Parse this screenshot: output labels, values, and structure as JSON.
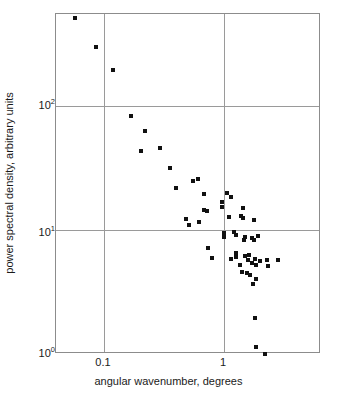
{
  "chart_data": {
    "type": "scatter",
    "title": "",
    "xlabel": "angular wavenumber, degrees",
    "ylabel": "power spectral density, arbitrary units",
    "xscale": "log",
    "yscale": "log",
    "xlim": [
      0.0562,
      4.34
    ],
    "ylim": [
      1.0,
      610
    ],
    "xticks": [
      0.1,
      1
    ],
    "xticklabels": [
      "0.1",
      "1"
    ],
    "yticks": [
      1,
      10,
      100
    ],
    "yticklabels": [
      "10⁰",
      "10¹",
      "10²"
    ],
    "grid": true,
    "grid_color": "#9a9a9a",
    "legend": "none",
    "marker": "square",
    "marker_color": "#111111",
    "marker_size_px": 4,
    "n_points": 59,
    "points": [
      {
        "x": 0.0575,
        "y": 513
      },
      {
        "x": 0.0862,
        "y": 300
      },
      {
        "x": 0.118,
        "y": 194
      },
      {
        "x": 0.167,
        "y": 83
      },
      {
        "x": 0.219,
        "y": 62.5
      },
      {
        "x": 0.203,
        "y": 43.5
      },
      {
        "x": 0.295,
        "y": 46.0
      },
      {
        "x": 0.352,
        "y": 31.5
      },
      {
        "x": 0.398,
        "y": 21.8
      },
      {
        "x": 0.478,
        "y": 12.3
      },
      {
        "x": 0.513,
        "y": 10.9
      },
      {
        "x": 0.556,
        "y": 25.0
      },
      {
        "x": 0.602,
        "y": 26.0
      },
      {
        "x": 0.617,
        "y": 11.6
      },
      {
        "x": 0.675,
        "y": 19.5
      },
      {
        "x": 0.681,
        "y": 14.6
      },
      {
        "x": 0.724,
        "y": 14.1
      },
      {
        "x": 0.74,
        "y": 7.2
      },
      {
        "x": 0.794,
        "y": 5.9
      },
      {
        "x": 0.955,
        "y": 15.4
      },
      {
        "x": 0.955,
        "y": 16.7
      },
      {
        "x": 1.05,
        "y": 20.0
      },
      {
        "x": 1.15,
        "y": 18.3
      },
      {
        "x": 1.1,
        "y": 12.8
      },
      {
        "x": 1.2,
        "y": 9.7
      },
      {
        "x": 1.0,
        "y": 9.4
      },
      {
        "x": 1.0,
        "y": 8.8
      },
      {
        "x": 1.38,
        "y": 13.0
      },
      {
        "x": 1.45,
        "y": 12.6
      },
      {
        "x": 1.45,
        "y": 15.1
      },
      {
        "x": 1.78,
        "y": 12.0
      },
      {
        "x": 1.26,
        "y": 9.1
      },
      {
        "x": 1.51,
        "y": 8.8
      },
      {
        "x": 1.48,
        "y": 8.3
      },
      {
        "x": 1.7,
        "y": 8.6
      },
      {
        "x": 1.78,
        "y": 8.3
      },
      {
        "x": 1.91,
        "y": 9.0
      },
      {
        "x": 1.26,
        "y": 6.5
      },
      {
        "x": 1.25,
        "y": 6.1
      },
      {
        "x": 1.15,
        "y": 5.8
      },
      {
        "x": 1.35,
        "y": 5.2
      },
      {
        "x": 1.51,
        "y": 6.2
      },
      {
        "x": 1.58,
        "y": 5.7
      },
      {
        "x": 1.62,
        "y": 6.3
      },
      {
        "x": 1.7,
        "y": 5.4
      },
      {
        "x": 1.82,
        "y": 5.8
      },
      {
        "x": 1.86,
        "y": 5.2
      },
      {
        "x": 2.0,
        "y": 5.6
      },
      {
        "x": 2.29,
        "y": 5.7
      },
      {
        "x": 2.34,
        "y": 5.1
      },
      {
        "x": 2.82,
        "y": 5.7
      },
      {
        "x": 1.41,
        "y": 4.6
      },
      {
        "x": 1.55,
        "y": 4.5
      },
      {
        "x": 1.66,
        "y": 4.3
      },
      {
        "x": 1.86,
        "y": 4.0
      },
      {
        "x": 1.74,
        "y": 3.7
      },
      {
        "x": 1.82,
        "y": 1.95
      },
      {
        "x": 1.86,
        "y": 1.13
      },
      {
        "x": 2.19,
        "y": 1.0
      }
    ]
  },
  "caption": {
    "text": ""
  }
}
